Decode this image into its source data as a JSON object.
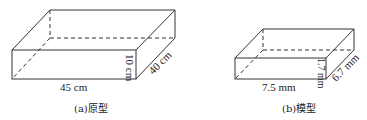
{
  "figure_a": {
    "caption": "(a)原型",
    "length": "45 cm",
    "height": "10 cm",
    "depth": "40 cm"
  },
  "figure_b": {
    "caption": "(b)模型",
    "length": "7.5 mm",
    "height": "1.7 mm",
    "depth": "6.7 mm"
  },
  "colors": {
    "line": "#333333",
    "background": "#ffffff"
  }
}
